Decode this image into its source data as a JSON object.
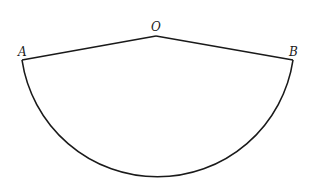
{
  "diagram": {
    "type": "circular-sector",
    "stroke_color": "#1a1a1a",
    "points": {
      "O": {
        "label": "O",
        "x": 156,
        "y": 36
      },
      "A": {
        "label": "A",
        "x": 22,
        "y": 60
      },
      "B": {
        "label": "B",
        "x": 293,
        "y": 60
      }
    },
    "radius": 137,
    "segments": [
      "OA",
      "OB"
    ],
    "arc": "AB"
  }
}
